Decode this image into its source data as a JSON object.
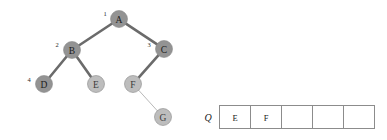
{
  "diagram": {
    "background": "#ffffff",
    "colors": {
      "node_visited": "#939393",
      "node_unvisited": "#bdbdbd",
      "node_stroke": "#8a8a8a",
      "edge_traversed": "#6b6b6b",
      "edge_pending": "#b9b9b9",
      "text": "#1b1b1b",
      "queue_border": "#8c8c8c"
    }
  },
  "tree": {
    "nodes": [
      {
        "id": "A",
        "label": "A",
        "x": 119,
        "y": 19,
        "r": 8.5,
        "state": "visited",
        "order": "1",
        "order_x": 105,
        "order_y": 13
      },
      {
        "id": "B",
        "label": "B",
        "x": 72,
        "y": 50,
        "r": 8.5,
        "state": "visited",
        "order": "2",
        "order_x": 57,
        "order_y": 44
      },
      {
        "id": "C",
        "label": "C",
        "x": 164,
        "y": 49,
        "r": 8.5,
        "state": "visited",
        "order": "3",
        "order_x": 149,
        "order_y": 44
      },
      {
        "id": "D",
        "label": "D",
        "x": 44,
        "y": 84,
        "r": 8.5,
        "state": "visited",
        "order": "4",
        "order_x": 29,
        "order_y": 79
      },
      {
        "id": "E",
        "label": "E",
        "x": 96,
        "y": 84,
        "r": 8.5,
        "state": "unvisited",
        "order": "",
        "order_x": 0,
        "order_y": 0
      },
      {
        "id": "F",
        "label": "F",
        "x": 133,
        "y": 84,
        "r": 8.5,
        "state": "unvisited",
        "order": "",
        "order_x": 0,
        "order_y": 0
      },
      {
        "id": "G",
        "label": "G",
        "x": 163,
        "y": 117,
        "r": 8.5,
        "state": "unvisited",
        "order": "",
        "order_x": 0,
        "order_y": 0
      }
    ],
    "edges": [
      {
        "from": "A",
        "to": "B",
        "state": "traversed"
      },
      {
        "from": "A",
        "to": "C",
        "state": "traversed"
      },
      {
        "from": "B",
        "to": "D",
        "state": "traversed"
      },
      {
        "from": "B",
        "to": "E",
        "state": "traversed"
      },
      {
        "from": "C",
        "to": "F",
        "state": "traversed"
      },
      {
        "from": "F",
        "to": "G",
        "state": "pending"
      }
    ]
  },
  "queue": {
    "label": "Q",
    "label_x": 208,
    "label_y": 117,
    "box_x": 219,
    "box_y": 105,
    "cell_width": 31,
    "cell_height": 23,
    "cells": [
      {
        "value": "E",
        "filled": true
      },
      {
        "value": "F",
        "filled": true
      },
      {
        "value": "",
        "filled": false
      },
      {
        "value": "",
        "filled": false
      },
      {
        "value": "",
        "filled": false
      }
    ]
  }
}
